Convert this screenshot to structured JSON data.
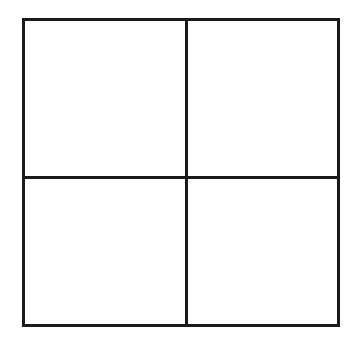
{
  "figure": {
    "type": "grid-diagram",
    "background_color": "#ffffff",
    "line_color": "#1a1a1a",
    "line_width_px": 3,
    "frame": {
      "left_px": 22,
      "top_px": 18,
      "width_px": 318,
      "height_px": 309
    },
    "dividers": {
      "vertical_x_px": 185,
      "horizontal_y_px": 176
    },
    "quadrants": [
      {
        "id": "top-left",
        "label": "",
        "content": ""
      },
      {
        "id": "top-right",
        "label": "",
        "content": ""
      },
      {
        "id": "bottom-left",
        "label": "",
        "content": ""
      },
      {
        "id": "bottom-right",
        "label": "",
        "content": ""
      }
    ]
  }
}
